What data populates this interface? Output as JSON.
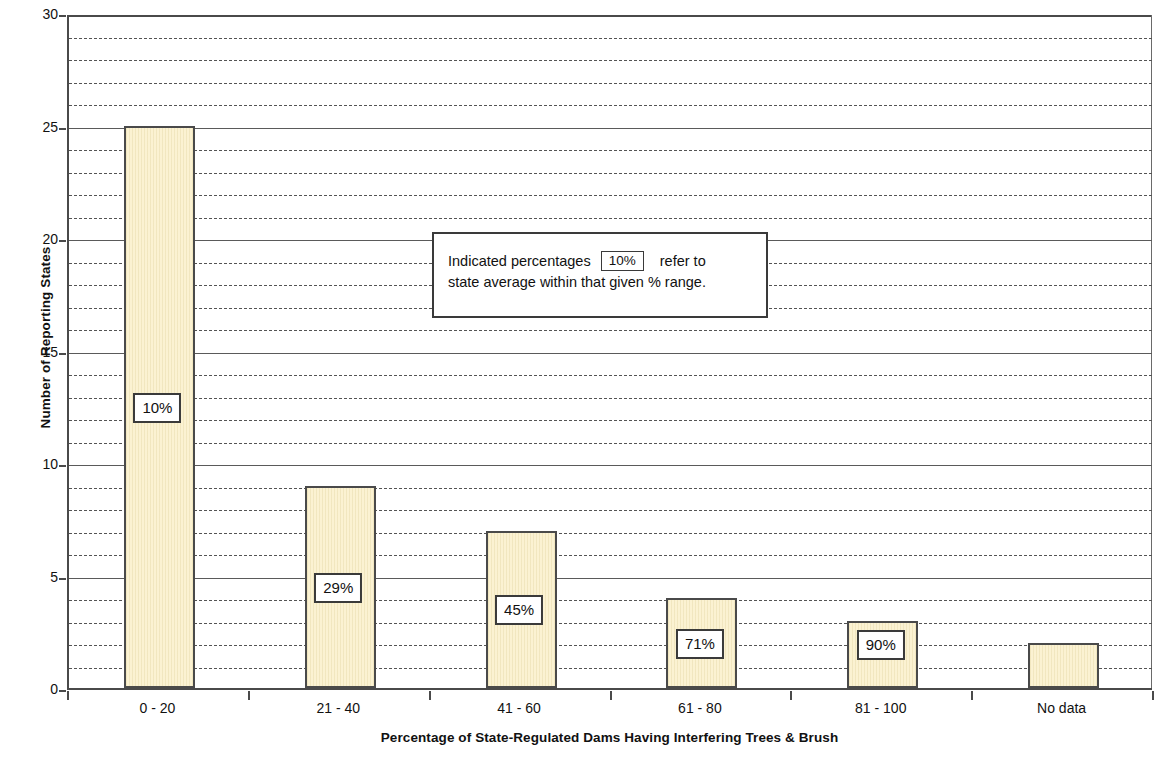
{
  "chart_data": {
    "type": "bar",
    "title": "",
    "xlabel": "Percentage of State-Regulated Dams Having Interfering Trees & Brush",
    "ylabel": "Number of Reporting States",
    "categories": [
      "0 - 20",
      "21 - 40",
      "41 - 60",
      "61 - 80",
      "81 - 100",
      "No data"
    ],
    "values": [
      25,
      9,
      7,
      4,
      3,
      2
    ],
    "point_labels": [
      "10%",
      "29%",
      "45%",
      "71%",
      "90%",
      ""
    ],
    "ylim": [
      0,
      30
    ],
    "y_major_ticks": [
      0,
      5,
      10,
      15,
      20,
      25,
      30
    ],
    "y_major_tick_labels": [
      "0",
      "5",
      "10",
      "15",
      "20",
      "25",
      "30"
    ],
    "y_minor_tick_interval": 1,
    "grid": "horizontal major solid, minor dashed",
    "legend_position": "inside-plot-upper-center",
    "bar_fill_color": "#fbf2d2",
    "bar_border_color": "#4a4a4a",
    "axis_color": "#4a4a4a",
    "gridline_color": "#545454"
  },
  "annotation": {
    "line1_prefix": "Indicated percentages",
    "swatch_label": "10%",
    "line1_suffix": "refer to",
    "line2": "state average within that given % range."
  }
}
